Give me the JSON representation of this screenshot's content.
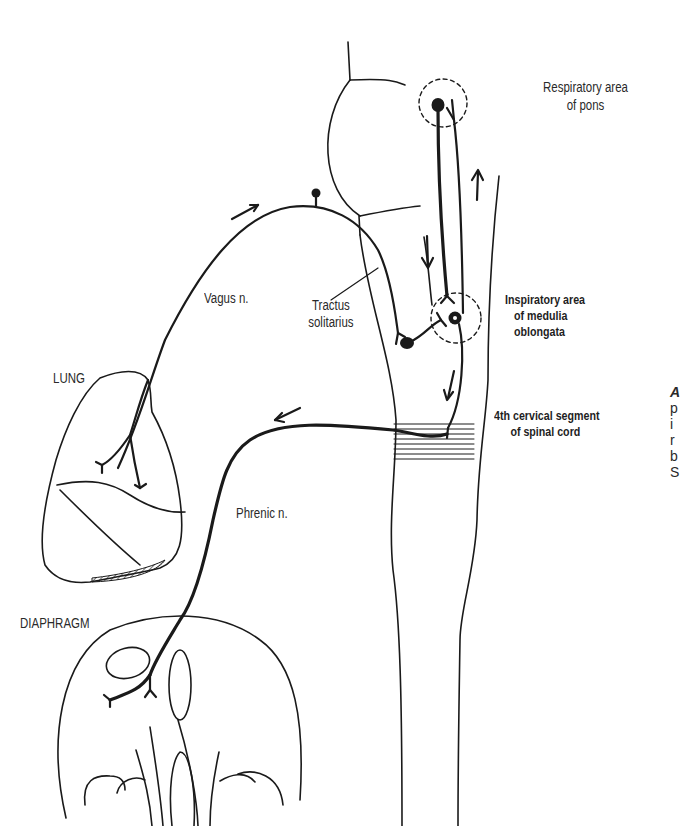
{
  "figure": {
    "labels": {
      "respiratory_area_pons": [
        "Respiratory area",
        "of pons"
      ],
      "inspiratory_area_medulla": [
        "Inspiratory area",
        "of medulia",
        "oblongata"
      ],
      "cervical_segment": [
        "4th cervical segment",
        "of spinal cord"
      ],
      "tractus_solitarius": [
        "Tractus",
        "solitarius"
      ],
      "vagus": "Vagus n.",
      "phrenic": "Phrenic n.",
      "lung": "LUNG",
      "diaphragm": "DIAPHRAGM"
    },
    "clipped_caption_fragments": [
      "A",
      "p",
      "i",
      "r",
      "b",
      "S"
    ],
    "colors": {
      "ink": "#1a1a1a",
      "background": "#ffffff"
    },
    "arrows": [
      {
        "id": "vagus-afferent",
        "direction": "up-right",
        "meaning": "impulses from lung via vagus"
      },
      {
        "id": "pons-descending",
        "direction": "down"
      },
      {
        "id": "pons-ascending",
        "direction": "up"
      },
      {
        "id": "medulla-to-cord",
        "direction": "down"
      },
      {
        "id": "phrenic-efferent",
        "direction": "down-left",
        "meaning": "impulses to diaphragm via phrenic"
      }
    ]
  }
}
